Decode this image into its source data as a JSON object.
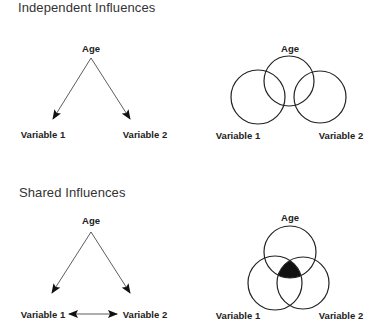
{
  "sections": [
    {
      "title": "Independent Influences",
      "arrow_diagram": {
        "top_node": "Age",
        "left_node": "Variable 1",
        "right_node": "Variable 2",
        "edges": [
          "Age -> Variable 1",
          "Age -> Variable 2"
        ]
      },
      "venn_diagram": {
        "top_circle": "Age",
        "left_circle": "Variable 1",
        "right_circle": "Variable 2",
        "shared_region_filled": false
      }
    },
    {
      "title": "Shared Influences",
      "arrow_diagram": {
        "top_node": "Age",
        "left_node": "Variable 1",
        "right_node": "Variable 2",
        "edges": [
          "Age -> Variable 1",
          "Age -> Variable 2",
          "Variable 1 <-> Variable 2"
        ]
      },
      "venn_diagram": {
        "top_circle": "Age",
        "left_circle": "Variable 1",
        "right_circle": "Variable 2",
        "shared_region_filled": true,
        "shared_region_color": "#111111"
      }
    }
  ],
  "colors": {
    "stroke": "#222222",
    "text": "#222222",
    "title": "#333333",
    "fill": "#111111"
  }
}
